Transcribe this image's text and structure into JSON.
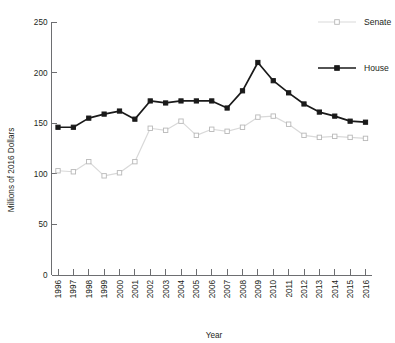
{
  "chart_data": {
    "type": "line",
    "title": "",
    "xlabel": "Year",
    "ylabel": "Millions of 2016 Dollars",
    "ylim": [
      0,
      250
    ],
    "yticks": [
      0,
      50,
      100,
      150,
      200,
      250
    ],
    "grid": false,
    "legend_position": "right-top",
    "categories": [
      "1996",
      "1997",
      "1998",
      "1999",
      "2000",
      "2001",
      "2002",
      "2003",
      "2004",
      "2005",
      "2006",
      "2007",
      "2008",
      "2009",
      "2010",
      "2011",
      "2012",
      "2013",
      "2014",
      "2015",
      "2016"
    ],
    "series": [
      {
        "name": "Senate",
        "color": "#d9d9d9",
        "marker": "open-square",
        "values": [
          103,
          102,
          112,
          98,
          101,
          112,
          145,
          143,
          152,
          138,
          144,
          142,
          146,
          156,
          157,
          149,
          138,
          136,
          137,
          136,
          135
        ]
      },
      {
        "name": "House",
        "color": "#1a1a1a",
        "marker": "filled-square",
        "values": [
          146,
          146,
          155,
          159,
          162,
          154,
          172,
          170,
          172,
          172,
          172,
          165,
          182,
          210,
          192,
          180,
          169,
          161,
          157,
          152,
          151
        ]
      }
    ]
  },
  "legend": {
    "items": [
      {
        "label": "Senate",
        "color": "#d9d9d9",
        "marker": "open-square"
      },
      {
        "label": "House",
        "color": "#1a1a1a",
        "marker": "filled-square"
      }
    ]
  },
  "axis": {
    "y_title": "Millions of 2016 Dollars",
    "x_title": "Year",
    "y_tick_labels": [
      "0",
      "50",
      "100",
      "150",
      "200",
      "250"
    ],
    "x_tick_labels": [
      "1996",
      "1997",
      "1998",
      "1999",
      "2000",
      "2001",
      "2002",
      "2003",
      "2004",
      "2005",
      "2006",
      "2007",
      "2008",
      "2009",
      "2010",
      "2011",
      "2012",
      "2013",
      "2014",
      "2015",
      "2016"
    ]
  }
}
